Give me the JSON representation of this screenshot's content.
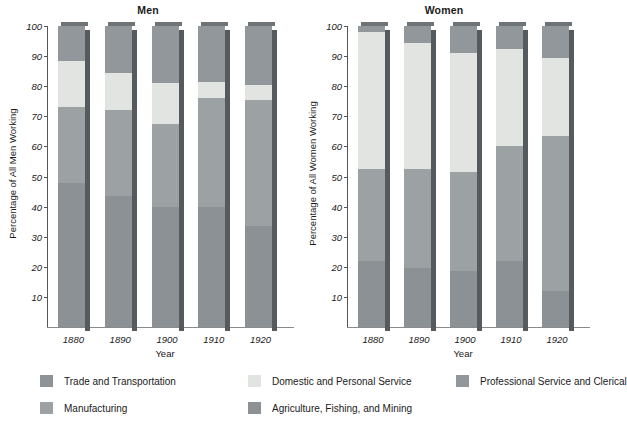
{
  "chart_data": {
    "type": "bar",
    "title": "",
    "subtype": "stacked-bar-100-percent",
    "grid": false,
    "legend_position": "bottom",
    "categories": [
      "1880",
      "1890",
      "1900",
      "1910",
      "1920"
    ],
    "xlabel": "Year",
    "ylim": [
      0,
      100
    ],
    "ytick_labels": [
      "10",
      "20",
      "30",
      "40",
      "50",
      "60",
      "70",
      "80",
      "90",
      "100"
    ],
    "yticks": [
      10,
      20,
      30,
      40,
      50,
      60,
      70,
      80,
      90,
      100
    ],
    "panels": [
      {
        "title": "Men",
        "ylabel": "Percentage of All Men Working",
        "series": [
          {
            "name": "Agriculture, Fishing, and Mining",
            "color": "#8c9195",
            "values": [
              48.0,
              43.5,
              40.0,
              40.0,
              33.5
            ]
          },
          {
            "name": "Manufacturing",
            "color": "#9ca1a4",
            "values": [
              25.0,
              28.5,
              27.5,
              36.0,
              42.0
            ]
          },
          {
            "name": "Trade and Transportation",
            "color": "#8e9397",
            "values": [
              0.0,
              0.0,
              0.0,
              0.0,
              0.0
            ]
          },
          {
            "name": "Domestic and Personal Service",
            "color": "#e2e4e2",
            "values": [
              15.5,
              12.5,
              13.5,
              5.5,
              5.0
            ]
          },
          {
            "name": "Professional Service and Clerical",
            "color": "#92979b",
            "values": [
              11.5,
              15.5,
              19.0,
              18.5,
              19.5
            ]
          }
        ]
      },
      {
        "title": "Women",
        "ylabel": "Percentage of All Women Working",
        "series": [
          {
            "name": "Agriculture, Fishing, and Mining",
            "color": "#8c9195",
            "values": [
              22.0,
              19.5,
              18.5,
              22.0,
              12.0
            ]
          },
          {
            "name": "Manufacturing",
            "color": "#9ca1a4",
            "values": [
              30.5,
              33.0,
              33.0,
              38.0,
              51.5
            ]
          },
          {
            "name": "Trade and Transportation",
            "color": "#8e9397",
            "values": [
              0.0,
              0.0,
              0.0,
              0.0,
              0.0
            ]
          },
          {
            "name": "Domestic and Personal Service",
            "color": "#e2e4e2",
            "values": [
              45.5,
              42.0,
              39.5,
              32.5,
              26.0
            ]
          },
          {
            "name": "Professional Service and Clerical",
            "color": "#92979b",
            "values": [
              2.0,
              5.5,
              9.0,
              7.5,
              10.5
            ]
          }
        ]
      }
    ]
  },
  "legend": {
    "items": [
      {
        "label": "Trade and Transportation",
        "color": "#8e9397",
        "row": 0,
        "col": 0
      },
      {
        "label": "Domestic and Personal Service",
        "color": "#e2e4e2",
        "row": 0,
        "col": 1
      },
      {
        "label": "Professional Service and Clerical",
        "color": "#92979b",
        "row": 0,
        "col": 2
      },
      {
        "label": "Manufacturing",
        "color": "#9ca1a4",
        "row": 1,
        "col": 0
      },
      {
        "label": "Agriculture, Fishing, and Mining",
        "color": "#8c9195",
        "row": 1,
        "col": 1
      }
    ]
  },
  "caption": {
    "text": ""
  }
}
